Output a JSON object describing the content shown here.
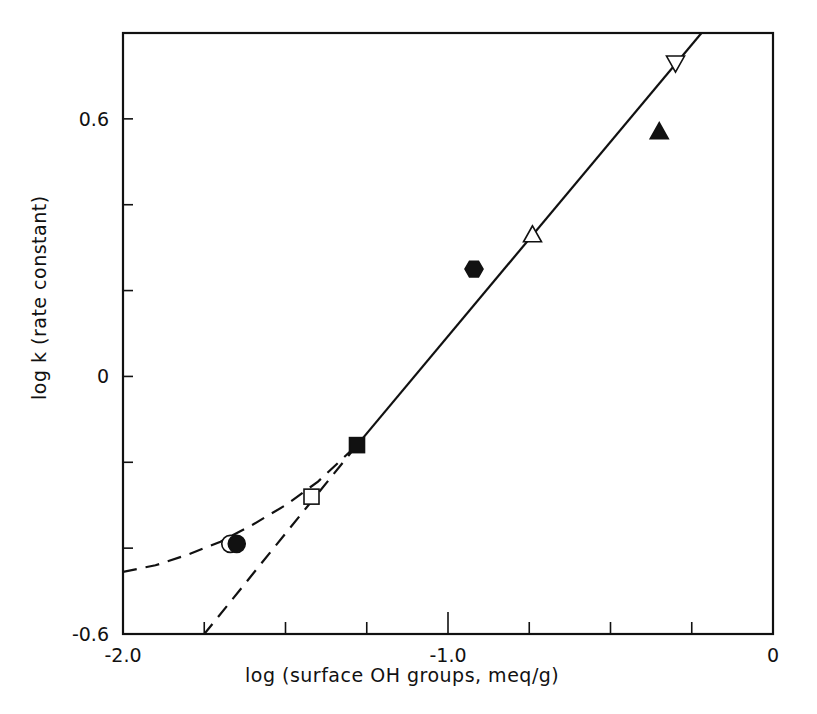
{
  "chart_data": {
    "type": "scatter",
    "title": "",
    "xlabel": "log (surface OH groups, meq/g)",
    "ylabel": "log  k (rate constant)",
    "xlim": [
      -2.0,
      0
    ],
    "ylim": [
      -0.6,
      0.8
    ],
    "grid": false,
    "legend": null,
    "x_ticks": [
      -2.0,
      -1.75,
      -1.5,
      -1.25,
      -1.0,
      -0.75,
      -0.5,
      -0.25,
      0
    ],
    "x_tick_labels": [
      {
        "value": -2.0,
        "label": "-2.0"
      },
      {
        "value": -1.0,
        "label": "-1.0"
      },
      {
        "value": 0,
        "label": "0"
      }
    ],
    "y_ticks": [
      -0.6,
      -0.4,
      -0.2,
      0,
      0.2,
      0.4,
      0.6
    ],
    "y_tick_labels": [
      {
        "value": 0.6,
        "label": "0.6"
      },
      {
        "value": 0,
        "label": "0"
      },
      {
        "value": -0.6,
        "label": "-0.6"
      }
    ],
    "series": [
      {
        "name": "open circle",
        "marker": "circle",
        "filled": false,
        "x": -1.67,
        "y": -0.39
      },
      {
        "name": "filled circle",
        "marker": "circle",
        "filled": true,
        "x": -1.65,
        "y": -0.39
      },
      {
        "name": "open square",
        "marker": "square",
        "filled": false,
        "x": -1.42,
        "y": -0.28
      },
      {
        "name": "filled square",
        "marker": "square",
        "filled": true,
        "x": -1.28,
        "y": -0.16
      },
      {
        "name": "filled hexagon",
        "marker": "hexagon",
        "filled": true,
        "x": -0.92,
        "y": 0.25
      },
      {
        "name": "open triangle up",
        "marker": "triangle-up",
        "filled": false,
        "x": -0.74,
        "y": 0.33
      },
      {
        "name": "filled triangle up",
        "marker": "triangle-up",
        "filled": true,
        "x": -0.35,
        "y": 0.57
      },
      {
        "name": "open triangle down",
        "marker": "triangle-down",
        "filled": false,
        "x": -0.3,
        "y": 0.73
      }
    ],
    "lines": [
      {
        "name": "linear fit (solid)",
        "style": "solid",
        "points": [
          [
            -1.28,
            -0.16
          ],
          [
            -0.22,
            0.8
          ]
        ]
      },
      {
        "name": "linear extrapolation (dashed)",
        "style": "dashed",
        "points": [
          [
            -1.28,
            -0.16
          ],
          [
            -1.75,
            -0.6
          ]
        ]
      },
      {
        "name": "curved fit (dashed)",
        "style": "dashed",
        "points": [
          [
            -2.0,
            -0.455
          ],
          [
            -1.9,
            -0.44
          ],
          [
            -1.8,
            -0.415
          ],
          [
            -1.7,
            -0.385
          ],
          [
            -1.6,
            -0.345
          ],
          [
            -1.5,
            -0.3
          ],
          [
            -1.4,
            -0.245
          ],
          [
            -1.28,
            -0.16
          ]
        ]
      }
    ]
  },
  "colors": {
    "ink": "#111111",
    "background": "#ffffff"
  }
}
